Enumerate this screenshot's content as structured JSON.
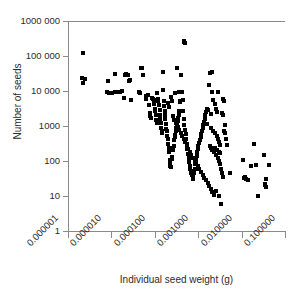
{
  "chart_data": {
    "type": "scatter",
    "title": "",
    "xlabel": "Individual seed weight (g)",
    "ylabel": "Number of seeds",
    "xscale": "log",
    "yscale": "log",
    "xlim": [
      1e-06,
      0.1
    ],
    "ylim": [
      1,
      1000000
    ],
    "grid": false,
    "legend": null,
    "marker": "square",
    "marker_color": "#000000",
    "marker_size_px": 4,
    "xticks": [
      1e-06,
      1e-05,
      0.0001,
      0.001,
      0.01,
      0.1
    ],
    "xticklabels": [
      "0.000001",
      "0.000010",
      "0.000100",
      "0.001000",
      "0.010000",
      "0.100000"
    ],
    "yticks": [
      1,
      10,
      100,
      1000,
      10000,
      100000,
      1000000
    ],
    "yticklabels": [
      "1",
      "10",
      "100",
      "1000",
      "10 000",
      "100 000",
      "1000 000"
    ],
    "n_points": 214,
    "points": [
      [
        2.2e-06,
        120000
      ],
      [
        2.1e-06,
        23000
      ],
      [
        2.4e-06,
        22000
      ],
      [
        2.2e-06,
        17000
      ],
      [
        8.5e-06,
        19000
      ],
      [
        7.8e-06,
        9500
      ],
      [
        8.8e-06,
        9000
      ],
      [
        1.05e-05,
        8500
      ],
      [
        1.22e-05,
        9200
      ],
      [
        1.25e-05,
        9500
      ],
      [
        1.18e-05,
        30000
      ],
      [
        1.6e-05,
        9300
      ],
      [
        1.75e-05,
        9800
      ],
      [
        1.95e-05,
        6500
      ],
      [
        2.05e-05,
        29000
      ],
      [
        2.15e-05,
        30000
      ],
      [
        2.35e-05,
        28000
      ],
      [
        2.5e-05,
        19000
      ],
      [
        2.7e-05,
        20500
      ],
      [
        2.9e-05,
        5700
      ],
      [
        4.3e-05,
        9300
      ],
      [
        4.65e-05,
        8600
      ],
      [
        4.8e-05,
        44000
      ],
      [
        5e-05,
        45000
      ],
      [
        5.3e-05,
        29000
      ],
      [
        6.2e-05,
        7000
      ],
      [
        6.4e-05,
        6000
      ],
      [
        6.8e-05,
        7600
      ],
      [
        7.2e-05,
        3900
      ],
      [
        7.6e-05,
        2300
      ],
      [
        7.9e-05,
        1900
      ],
      [
        8.2e-05,
        1650
      ],
      [
        8.5e-05,
        6500
      ],
      [
        8.8e-05,
        6200
      ],
      [
        9.1e-05,
        5900
      ],
      [
        9.4e-05,
        5600
      ],
      [
        9.6e-05,
        4300
      ],
      [
        9.9e-05,
        3100
      ],
      [
        0.000101,
        2600
      ],
      [
        0.000104,
        2000
      ],
      [
        0.000107,
        1450
      ],
      [
        0.00011,
        1250
      ],
      [
        0.000115,
        9000
      ],
      [
        0.000118,
        5800
      ],
      [
        0.000121,
        5200
      ],
      [
        0.000125,
        4000
      ],
      [
        0.000129,
        2900
      ],
      [
        0.000131,
        2000
      ],
      [
        0.000135,
        1600
      ],
      [
        0.000139,
        1250
      ],
      [
        0.000142,
        900
      ],
      [
        0.000146,
        700
      ],
      [
        0.00015,
        620
      ],
      [
        0.000152,
        36000
      ],
      [
        0.000156,
        10500
      ],
      [
        0.000161,
        5200
      ],
      [
        0.000165,
        3800
      ],
      [
        0.000168,
        2700
      ],
      [
        0.000172,
        2100
      ],
      [
        0.000176,
        1600
      ],
      [
        0.00018,
        1150
      ],
      [
        0.000185,
        820
      ],
      [
        0.00019,
        700
      ],
      [
        0.000196,
        520
      ],
      [
        0.0002,
        430
      ],
      [
        0.000206,
        310
      ],
      [
        0.00021,
        240
      ],
      [
        0.000216,
        180
      ],
      [
        0.00022,
        105
      ],
      [
        0.000225,
        80
      ],
      [
        0.00023,
        70
      ],
      [
        0.000238,
        68
      ],
      [
        0.000245,
        115
      ],
      [
        0.000252,
        130
      ],
      [
        0.00026,
        200
      ],
      [
        0.000268,
        230
      ],
      [
        0.000275,
        260
      ],
      [
        0.000282,
        400
      ],
      [
        0.00029,
        480
      ],
      [
        0.000298,
        560
      ],
      [
        0.000305,
        700
      ],
      [
        0.000315,
        900
      ],
      [
        0.000325,
        1100
      ],
      [
        0.000335,
        1350
      ],
      [
        0.000345,
        1700
      ],
      [
        0.000355,
        2100
      ],
      [
        0.000368,
        2600
      ],
      [
        0.00038,
        4800
      ],
      [
        0.00039,
        5200
      ],
      [
        0.000405,
        28000
      ],
      [
        0.00042,
        9400
      ],
      [
        0.000435,
        5500
      ],
      [
        0.00045,
        2700
      ],
      [
        0.000465,
        1600
      ],
      [
        0.00048,
        1050
      ],
      [
        0.000495,
        780
      ],
      [
        0.00051,
        600
      ],
      [
        0.000525,
        420
      ],
      [
        0.00054,
        300
      ],
      [
        0.00056,
        215
      ],
      [
        0.00058,
        160
      ],
      [
        0.0006,
        120
      ],
      [
        0.00062,
        95
      ],
      [
        0.00064,
        72
      ],
      [
        0.00066,
        60
      ],
      [
        0.00068,
        52
      ],
      [
        0.0007,
        45
      ],
      [
        0.00072,
        40
      ],
      [
        0.000745,
        34
      ],
      [
        0.00077,
        30
      ],
      [
        0.0008,
        45
      ],
      [
        0.00083,
        60
      ],
      [
        0.00086,
        80
      ],
      [
        0.00089,
        105
      ],
      [
        0.00092,
        135
      ],
      [
        0.00095,
        175
      ],
      [
        0.00098,
        220
      ],
      [
        0.00101,
        270
      ],
      [
        0.00105,
        330
      ],
      [
        0.00109,
        400
      ],
      [
        0.00113,
        480
      ],
      [
        0.00117,
        580
      ],
      [
        0.00121,
        700
      ],
      [
        0.00126,
        860
      ],
      [
        0.00131,
        1050
      ],
      [
        0.00136,
        1300
      ],
      [
        0.00141,
        1600
      ],
      [
        0.00147,
        2000
      ],
      [
        0.00153,
        2500
      ],
      [
        0.00159,
        3100
      ],
      [
        0.00047,
        250000
      ],
      [
        0.000482,
        260000
      ],
      [
        0.00049,
        235000
      ],
      [
        0.00033,
        45000
      ],
      [
        0.000355,
        9500
      ],
      [
        0.000295,
        8800
      ],
      [
        0.000235,
        6800
      ],
      [
        0.00025,
        5200
      ],
      [
        0.000198,
        4400
      ],
      [
        0.00021,
        3600
      ],
      [
        0.00026,
        1900
      ],
      [
        0.00028,
        1500
      ],
      [
        0.00031,
        1200
      ],
      [
        0.00034,
        950
      ],
      [
        0.00037,
        760
      ],
      [
        0.0004,
        620
      ],
      [
        0.00043,
        510
      ],
      [
        0.00046,
        415
      ],
      [
        0.0005,
        340
      ],
      [
        0.00054,
        275
      ],
      [
        0.00059,
        225
      ],
      [
        0.00064,
        185
      ],
      [
        0.0007,
        150
      ],
      [
        0.00076,
        125
      ],
      [
        0.00083,
        102
      ],
      [
        0.0009,
        86
      ],
      [
        0.00098,
        70
      ],
      [
        0.00107,
        58
      ],
      [
        0.00116,
        48
      ],
      [
        0.00127,
        40
      ],
      [
        0.00138,
        33
      ],
      [
        0.0015,
        28
      ],
      [
        0.00164,
        23
      ],
      [
        0.00178,
        19
      ],
      [
        0.00194,
        16
      ],
      [
        0.00211,
        13
      ],
      [
        0.0023,
        11
      ],
      [
        0.0019,
        32000
      ],
      [
        0.00205,
        36000
      ],
      [
        0.0018,
        15000
      ],
      [
        0.0021,
        9200
      ],
      [
        0.00225,
        5500
      ],
      [
        0.0024,
        4200
      ],
      [
        0.00255,
        3100
      ],
      [
        0.0027,
        2500
      ],
      [
        0.002,
        2200
      ],
      [
        0.0017,
        2900
      ],
      [
        0.0016,
        1150
      ],
      [
        0.00195,
        880
      ],
      [
        0.0022,
        720
      ],
      [
        0.00245,
        620
      ],
      [
        0.00265,
        520
      ],
      [
        0.00285,
        430
      ],
      [
        0.00305,
        350
      ],
      [
        0.00325,
        280
      ],
      [
        0.00208,
        210
      ],
      [
        0.00235,
        175
      ],
      [
        0.0026,
        145
      ],
      [
        0.0028,
        120
      ],
      [
        0.003,
        98
      ],
      [
        0.0032,
        82
      ],
      [
        0.00185,
        265
      ],
      [
        0.00198,
        230
      ],
      [
        0.0025,
        235
      ],
      [
        0.00275,
        205
      ],
      [
        0.00295,
        185
      ],
      [
        0.00315,
        165
      ],
      [
        0.0034,
        60
      ],
      [
        0.0036,
        45
      ],
      [
        0.0038,
        34
      ],
      [
        0.0029,
        9500
      ],
      [
        0.00345,
        2400
      ],
      [
        0.0037,
        2000
      ],
      [
        0.004,
        700
      ],
      [
        0.0042,
        620
      ],
      [
        0.0044,
        420
      ],
      [
        0.0046,
        290
      ],
      [
        0.00365,
        6000
      ],
      [
        0.00385,
        5200
      ],
      [
        0.0041,
        1050
      ],
      [
        0.0026,
        14
      ],
      [
        0.003,
        10
      ],
      [
        0.0034,
        6
      ],
      [
        0.0053,
        44
      ],
      [
        0.011,
        110
      ],
      [
        0.0115,
        32
      ],
      [
        0.012,
        34
      ],
      [
        0.0125,
        30
      ],
      [
        0.0138,
        28
      ],
      [
        0.019,
        300
      ],
      [
        0.0215,
        75
      ],
      [
        0.024,
        10
      ],
      [
        0.033,
        150
      ],
      [
        0.035,
        22
      ],
      [
        0.036,
        18
      ],
      [
        0.037,
        30
      ],
      [
        0.042,
        75
      ],
      [
        0.034,
        20
      ],
      [
        0.0165,
        72
      ]
    ]
  },
  "axes": {
    "y_title": "Number of seeds",
    "x_title": "Individual seed weight (g)",
    "y_tick_labels": [
      "1000 000",
      "100 000",
      "10 000",
      "1000",
      "100",
      "10",
      "1"
    ],
    "x_tick_labels": [
      "0.000001",
      "0.000010",
      "0.000100",
      "0.001000",
      "0.010000",
      "0.100000"
    ]
  }
}
